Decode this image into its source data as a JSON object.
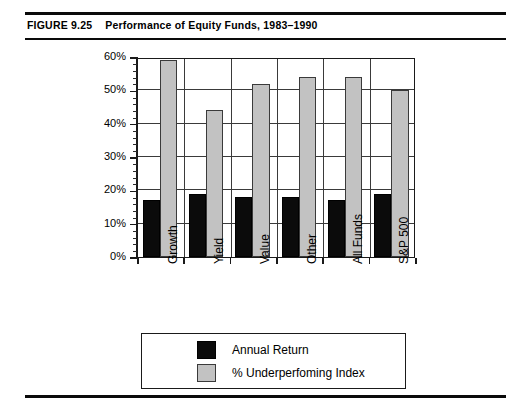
{
  "figure": {
    "number": "FIGURE 9.25",
    "caption": "Performance of Equity Funds, 1983–1990"
  },
  "chart_data": {
    "type": "bar",
    "title": "Performance of Equity Funds, 1983–1990",
    "xlabel": "",
    "ylabel": "",
    "categories": [
      "Growth",
      "Yield",
      "Value",
      "Other",
      "All Funds",
      "S&P 500"
    ],
    "series": [
      {
        "name": "Annual Return",
        "color": "#0b0b0b",
        "values": [
          17,
          19,
          18,
          18,
          17,
          19
        ]
      },
      {
        "name": "% Underperfoming Index",
        "color": "#c2c2c2",
        "values": [
          59,
          44,
          52,
          54,
          54,
          50
        ]
      }
    ],
    "ylim": [
      0,
      60
    ],
    "ytick_labels": [
      "0%",
      "10%",
      "20%",
      "30%",
      "40%",
      "50%",
      "60%"
    ],
    "ytick_values": [
      0,
      10,
      20,
      30,
      40,
      50,
      60
    ],
    "yminor_step": 2,
    "grid": "both",
    "legend_position": "bottom"
  }
}
